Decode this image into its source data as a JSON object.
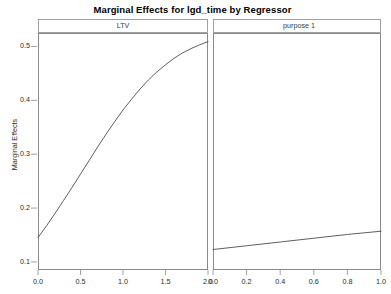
{
  "chart_data": {
    "type": "line",
    "title": "Marginal Effects for lgd_time by Regressor",
    "ylabel": "Marginal Effects",
    "xlabel": "",
    "grid": false,
    "legend": false,
    "shared_y_axis": true,
    "ylim": [
      0.085,
      0.525
    ],
    "yticks": [
      0.1,
      0.2,
      0.3,
      0.4,
      0.5
    ],
    "ytick_labels": [
      "0.1",
      "0.2",
      "0.3",
      "0.4",
      "0.5"
    ],
    "panels": [
      {
        "label": "LTV",
        "xlim": [
          0.0,
          2.0
        ],
        "xticks": [
          0.0,
          0.5,
          1.0,
          1.5,
          2.0
        ],
        "xtick_labels": [
          "0.0",
          "0.5",
          "1.0",
          "1.5",
          "2.0"
        ],
        "series": [
          {
            "name": "LTV marginal effect",
            "x": [
              0.0,
              0.1,
              0.2,
              0.3,
              0.4,
              0.5,
              0.6,
              0.7,
              0.8,
              0.9,
              1.0,
              1.1,
              1.2,
              1.3,
              1.4,
              1.5,
              1.6,
              1.7,
              1.8,
              1.9,
              2.0
            ],
            "y": [
              0.145,
              0.167,
              0.19,
              0.214,
              0.238,
              0.263,
              0.288,
              0.313,
              0.337,
              0.36,
              0.382,
              0.402,
              0.421,
              0.438,
              0.453,
              0.466,
              0.478,
              0.488,
              0.496,
              0.503,
              0.509
            ]
          }
        ]
      },
      {
        "label": "purpose 1",
        "xlim": [
          0.0,
          1.0
        ],
        "xticks": [
          0.0,
          0.2,
          0.4,
          0.6,
          0.8,
          1.0
        ],
        "xtick_labels": [
          "0.0",
          "0.2",
          "0.4",
          "0.6",
          "0.8",
          "1.0"
        ],
        "series": [
          {
            "name": "purpose 1 marginal effect",
            "x": [
              0.0,
              0.2,
              0.4,
              0.6,
              0.8,
              1.0
            ],
            "y": [
              0.123,
              0.13,
              0.137,
              0.144,
              0.151,
              0.157
            ]
          }
        ]
      }
    ],
    "colors": {
      "line": "#4d4d4d",
      "frame": "#8a8a8a",
      "background": "#ffffff",
      "text": "#1a1a1a"
    }
  }
}
